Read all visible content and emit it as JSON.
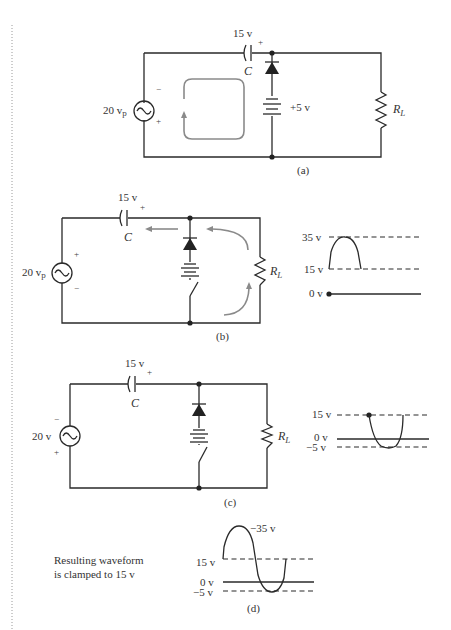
{
  "colors": {
    "ink": "#2a2a2a",
    "flow_arrow": "#8a8a8a",
    "background": "#ffffff"
  },
  "panel_a": {
    "caption": "(a)",
    "capacitor_voltage": "15 v",
    "capacitor_label": "C",
    "capacitor_plus": "+",
    "source_label": "20 v",
    "source_sub": "p",
    "source_minus": "−",
    "source_plus": "+",
    "battery_label": "+5 v",
    "load_label": "R",
    "load_sub": "L"
  },
  "panel_b": {
    "caption": "(b)",
    "capacitor_voltage": "15 v",
    "capacitor_label": "C",
    "capacitor_plus": "+",
    "source_label": "20 v",
    "source_sub": "p",
    "source_plus": "+",
    "source_minus": "−",
    "load_label": "R",
    "load_sub": "L",
    "waveform": {
      "levels": [
        "35 v",
        "15 v",
        "0 v"
      ]
    }
  },
  "panel_c": {
    "caption": "(c)",
    "capacitor_voltage": "15 v",
    "capacitor_label": "C",
    "capacitor_plus": "+",
    "source_label": "20 v",
    "source_minus": "−",
    "source_plus": "+",
    "load_label": "R",
    "load_sub": "L",
    "waveform": {
      "levels": [
        "15 v",
        "0 v",
        "−5 v"
      ]
    }
  },
  "panel_d": {
    "caption": "(d)",
    "note_line1": "Resulting waveform",
    "note_line2": "is clamped to 15 v",
    "peak_label": "−35 v",
    "levels": [
      "15 v",
      "0 v",
      "−5 v"
    ]
  }
}
